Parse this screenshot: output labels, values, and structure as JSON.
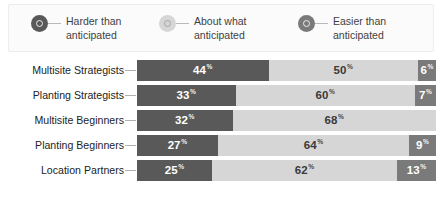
{
  "colors": {
    "harder": "#595959",
    "about": "#d6d6d6",
    "easier": "#7a7a7a",
    "legend_bg": "#fbfbfb",
    "legend_border": "#ededed",
    "label_text": "#232323",
    "connector": "#b0b0b0",
    "page_bg": "#ffffff"
  },
  "legend": {
    "items": [
      {
        "label": "Harder than anticipated",
        "marker": "target-circle-icon",
        "color": "#595959",
        "tone": "dark"
      },
      {
        "label": "About what anticipated",
        "marker": "target-circle-icon",
        "color": "#d6d6d6",
        "tone": "light"
      },
      {
        "label": "Easier than anticipated",
        "marker": "target-circle-icon",
        "color": "#7a7a7a",
        "tone": "dark"
      }
    ]
  },
  "chart_data": {
    "type": "bar",
    "subtype": "stacked-horizontal-100",
    "title": "",
    "subtitle": "",
    "xlabel": "",
    "ylabel": "",
    "xlim": [
      0,
      100
    ],
    "grid": false,
    "legend_position": "top",
    "value_suffix": "%",
    "categories": [
      "Multisite Strategists",
      "Planting Strategists",
      "Multisite Beginners",
      "Planting Beginners",
      "Location Partners"
    ],
    "series": [
      {
        "name": "Harder than anticipated",
        "color": "#595959",
        "values": [
          44,
          33,
          32,
          27,
          25
        ]
      },
      {
        "name": "About what anticipated",
        "color": "#d6d6d6",
        "values": [
          50,
          60,
          68,
          64,
          62
        ]
      },
      {
        "name": "Easier than anticipated",
        "color": "#7a7a7a",
        "values": [
          6,
          7,
          0,
          9,
          13
        ]
      }
    ],
    "rows": [
      {
        "category": "Multisite Strategists",
        "segments": [
          {
            "series": "Harder than anticipated",
            "value": 44,
            "display": "44",
            "suffix": "%",
            "tone": "dark"
          },
          {
            "series": "About what anticipated",
            "value": 50,
            "display": "50",
            "suffix": "%",
            "tone": "mid"
          },
          {
            "series": "Easier than anticipated",
            "value": 6,
            "display": "6",
            "suffix": "%",
            "tone": "accent"
          }
        ]
      },
      {
        "category": "Planting Strategists",
        "segments": [
          {
            "series": "Harder than anticipated",
            "value": 33,
            "display": "33",
            "suffix": "%",
            "tone": "dark"
          },
          {
            "series": "About what anticipated",
            "value": 60,
            "display": "60",
            "suffix": "%",
            "tone": "mid"
          },
          {
            "series": "Easier than anticipated",
            "value": 7,
            "display": "7",
            "suffix": "%",
            "tone": "accent"
          }
        ]
      },
      {
        "category": "Multisite Beginners",
        "segments": [
          {
            "series": "Harder than anticipated",
            "value": 32,
            "display": "32",
            "suffix": "%",
            "tone": "dark"
          },
          {
            "series": "About what anticipated",
            "value": 68,
            "display": "68",
            "suffix": "%",
            "tone": "mid"
          }
        ]
      },
      {
        "category": "Planting Beginners",
        "segments": [
          {
            "series": "Harder than anticipated",
            "value": 27,
            "display": "27",
            "suffix": "%",
            "tone": "dark"
          },
          {
            "series": "About what anticipated",
            "value": 64,
            "display": "64",
            "suffix": "%",
            "tone": "mid"
          },
          {
            "series": "Easier than anticipated",
            "value": 9,
            "display": "9",
            "suffix": "%",
            "tone": "accent"
          }
        ]
      },
      {
        "category": "Location Partners",
        "segments": [
          {
            "series": "Harder than anticipated",
            "value": 25,
            "display": "25",
            "suffix": "%",
            "tone": "dark"
          },
          {
            "series": "About what anticipated",
            "value": 62,
            "display": "62",
            "suffix": "%",
            "tone": "mid"
          },
          {
            "series": "Easier than anticipated",
            "value": 13,
            "display": "13",
            "suffix": "%",
            "tone": "accent"
          }
        ]
      }
    ]
  }
}
